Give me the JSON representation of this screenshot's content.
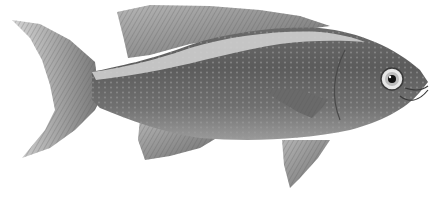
{
  "image": {
    "subject": "fish illustration",
    "style": "grayscale engraving",
    "background": "#ffffff",
    "colors": {
      "body_dark": "#5a5a5a",
      "body_mid": "#7d7d7d",
      "lateral_stripe": "#c9c9c9",
      "fin": "#8a8a8a",
      "fin_light": "#d8d8d8",
      "eye_ring": "#e6e6e6",
      "pupil": "#111111"
    }
  }
}
